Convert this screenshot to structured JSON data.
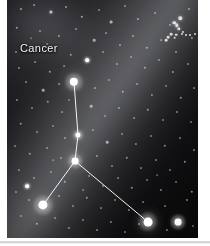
{
  "figure": {
    "kind": "astrophotograph",
    "subject_label": "Cancer",
    "plate": {
      "left": 7,
      "top": 0,
      "width": 191,
      "height": 238,
      "background_color": "#050507",
      "margin_color": "#ffffff"
    },
    "bottom_rule": {
      "color": "#d6d6d6",
      "top": 241,
      "height": 2
    }
  },
  "label": {
    "text": "Cancer",
    "color": "#f2f2f2",
    "x": 13,
    "y": 42
  },
  "glow": {
    "name": "zodiacal-light-band",
    "angle_deg": 34,
    "color": "#eceef5",
    "description": "broad diffuse diagonal glow from upper right to lower left"
  },
  "asterism": {
    "name": "cancer-y-asterism",
    "line_color": "#f5f5f5",
    "line_width": 1,
    "nodes": [
      {
        "id": "n1",
        "name": "iota-cancri",
        "x": 67,
        "y": 82,
        "r": 4.2,
        "brightness": "bright"
      },
      {
        "id": "n2",
        "name": "gamma-cancri",
        "x": 71,
        "y": 135,
        "r": 2.6,
        "brightness": "medium"
      },
      {
        "id": "n3",
        "name": "delta-cancri",
        "x": 68,
        "y": 161,
        "r": 3.4,
        "brightness": "bright"
      },
      {
        "id": "n4",
        "name": "beta-cancri",
        "x": 36,
        "y": 205,
        "r": 4.6,
        "brightness": "bright"
      },
      {
        "id": "n5",
        "name": "alpha-cancri",
        "x": 141,
        "y": 222,
        "r": 4.4,
        "brightness": "bright"
      }
    ],
    "edges": [
      {
        "from": "n1",
        "to": "n2"
      },
      {
        "from": "n2",
        "to": "n3"
      },
      {
        "from": "n3",
        "to": "n4"
      },
      {
        "from": "n3",
        "to": "n5"
      }
    ]
  },
  "cluster": {
    "name": "beehive-cluster",
    "x": 172,
    "y": 32,
    "radius": 16,
    "member_count": 14
  },
  "starfield": {
    "color": "#ffffff",
    "stars": [
      {
        "x": 14,
        "y": 9,
        "r": 1.1,
        "o": 0.55
      },
      {
        "x": 27,
        "y": 5,
        "r": 0.9,
        "o": 0.45
      },
      {
        "x": 44,
        "y": 12,
        "r": 1.6,
        "o": 0.7
      },
      {
        "x": 59,
        "y": 7,
        "r": 1.0,
        "o": 0.5
      },
      {
        "x": 75,
        "y": 17,
        "r": 1.2,
        "o": 0.55
      },
      {
        "x": 92,
        "y": 10,
        "r": 1.0,
        "o": 0.45
      },
      {
        "x": 104,
        "y": 22,
        "r": 1.4,
        "o": 0.6
      },
      {
        "x": 118,
        "y": 6,
        "r": 1.0,
        "o": 0.45
      },
      {
        "x": 131,
        "y": 19,
        "r": 1.1,
        "o": 0.5
      },
      {
        "x": 148,
        "y": 13,
        "r": 0.9,
        "o": 0.4
      },
      {
        "x": 163,
        "y": 25,
        "r": 1.0,
        "o": 0.45
      },
      {
        "x": 182,
        "y": 9,
        "r": 1.1,
        "o": 0.5
      },
      {
        "x": 10,
        "y": 28,
        "r": 1.2,
        "o": 0.5
      },
      {
        "x": 33,
        "y": 31,
        "r": 1.0,
        "o": 0.45
      },
      {
        "x": 52,
        "y": 36,
        "r": 1.1,
        "o": 0.5
      },
      {
        "x": 69,
        "y": 29,
        "r": 0.9,
        "o": 0.4
      },
      {
        "x": 87,
        "y": 40,
        "r": 1.3,
        "o": 0.55
      },
      {
        "x": 99,
        "y": 33,
        "r": 0.9,
        "o": 0.4
      },
      {
        "x": 113,
        "y": 45,
        "r": 1.0,
        "o": 0.45
      },
      {
        "x": 126,
        "y": 36,
        "r": 1.1,
        "o": 0.5
      },
      {
        "x": 140,
        "y": 48,
        "r": 1.2,
        "o": 0.5
      },
      {
        "x": 154,
        "y": 40,
        "r": 0.9,
        "o": 0.4
      },
      {
        "x": 169,
        "y": 52,
        "r": 1.0,
        "o": 0.45
      },
      {
        "x": 185,
        "y": 38,
        "r": 1.1,
        "o": 0.5
      },
      {
        "x": 9,
        "y": 52,
        "r": 1.0,
        "o": 0.42
      },
      {
        "x": 64,
        "y": 55,
        "r": 1.2,
        "o": 0.5
      },
      {
        "x": 80,
        "y": 60,
        "r": 1.5,
        "o": 0.62
      },
      {
        "x": 96,
        "y": 52,
        "r": 1.0,
        "o": 0.45
      },
      {
        "x": 110,
        "y": 64,
        "r": 1.1,
        "o": 0.48
      },
      {
        "x": 124,
        "y": 57,
        "r": 0.9,
        "o": 0.4
      },
      {
        "x": 138,
        "y": 68,
        "r": 1.2,
        "o": 0.5
      },
      {
        "x": 152,
        "y": 60,
        "r": 1.0,
        "o": 0.42
      },
      {
        "x": 166,
        "y": 72,
        "r": 1.1,
        "o": 0.48
      },
      {
        "x": 181,
        "y": 64,
        "r": 1.0,
        "o": 0.45
      },
      {
        "x": 12,
        "y": 68,
        "r": 1.1,
        "o": 0.45
      },
      {
        "x": 28,
        "y": 62,
        "r": 0.9,
        "o": 0.4
      },
      {
        "x": 43,
        "y": 72,
        "r": 1.2,
        "o": 0.5
      },
      {
        "x": 57,
        "y": 66,
        "r": 0.9,
        "o": 0.38
      },
      {
        "x": 19,
        "y": 82,
        "r": 1.0,
        "o": 0.45
      },
      {
        "x": 36,
        "y": 90,
        "r": 1.3,
        "o": 0.55
      },
      {
        "x": 52,
        "y": 84,
        "r": 0.9,
        "o": 0.4
      },
      {
        "x": 88,
        "y": 88,
        "r": 1.1,
        "o": 0.48
      },
      {
        "x": 102,
        "y": 80,
        "r": 1.0,
        "o": 0.42
      },
      {
        "x": 116,
        "y": 92,
        "r": 1.2,
        "o": 0.5
      },
      {
        "x": 130,
        "y": 84,
        "r": 0.9,
        "o": 0.4
      },
      {
        "x": 145,
        "y": 95,
        "r": 1.1,
        "o": 0.46
      },
      {
        "x": 159,
        "y": 86,
        "r": 1.0,
        "o": 0.42
      },
      {
        "x": 174,
        "y": 98,
        "r": 1.2,
        "o": 0.5
      },
      {
        "x": 187,
        "y": 88,
        "r": 0.9,
        "o": 0.4
      },
      {
        "x": 10,
        "y": 100,
        "r": 1.1,
        "o": 0.45
      },
      {
        "x": 25,
        "y": 108,
        "r": 1.0,
        "o": 0.42
      },
      {
        "x": 41,
        "y": 102,
        "r": 1.2,
        "o": 0.5
      },
      {
        "x": 55,
        "y": 112,
        "r": 0.9,
        "o": 0.38
      },
      {
        "x": 84,
        "y": 106,
        "r": 1.3,
        "o": 0.55
      },
      {
        "x": 98,
        "y": 116,
        "r": 1.0,
        "o": 0.42
      },
      {
        "x": 112,
        "y": 108,
        "r": 1.1,
        "o": 0.46
      },
      {
        "x": 127,
        "y": 118,
        "r": 0.9,
        "o": 0.4
      },
      {
        "x": 141,
        "y": 110,
        "r": 1.2,
        "o": 0.5
      },
      {
        "x": 156,
        "y": 120,
        "r": 1.0,
        "o": 0.42
      },
      {
        "x": 170,
        "y": 112,
        "r": 1.1,
        "o": 0.46
      },
      {
        "x": 184,
        "y": 122,
        "r": 1.0,
        "o": 0.42
      },
      {
        "x": 14,
        "y": 124,
        "r": 1.2,
        "o": 0.5
      },
      {
        "x": 30,
        "y": 132,
        "r": 1.0,
        "o": 0.42
      },
      {
        "x": 46,
        "y": 126,
        "r": 0.9,
        "o": 0.38
      },
      {
        "x": 58,
        "y": 138,
        "r": 1.1,
        "o": 0.46
      },
      {
        "x": 86,
        "y": 130,
        "r": 1.0,
        "o": 0.42
      },
      {
        "x": 100,
        "y": 142,
        "r": 1.3,
        "o": 0.55
      },
      {
        "x": 115,
        "y": 134,
        "r": 0.9,
        "o": 0.4
      },
      {
        "x": 129,
        "y": 144,
        "r": 1.1,
        "o": 0.46
      },
      {
        "x": 144,
        "y": 136,
        "r": 1.0,
        "o": 0.42
      },
      {
        "x": 158,
        "y": 146,
        "r": 1.2,
        "o": 0.5
      },
      {
        "x": 173,
        "y": 138,
        "r": 0.9,
        "o": 0.4
      },
      {
        "x": 187,
        "y": 150,
        "r": 1.1,
        "o": 0.46
      },
      {
        "x": 8,
        "y": 146,
        "r": 1.0,
        "o": 0.42
      },
      {
        "x": 23,
        "y": 154,
        "r": 1.2,
        "o": 0.5
      },
      {
        "x": 40,
        "y": 148,
        "r": 0.9,
        "o": 0.38
      },
      {
        "x": 54,
        "y": 158,
        "r": 1.0,
        "o": 0.42
      },
      {
        "x": 90,
        "y": 156,
        "r": 1.1,
        "o": 0.46
      },
      {
        "x": 105,
        "y": 166,
        "r": 1.0,
        "o": 0.42
      },
      {
        "x": 120,
        "y": 158,
        "r": 1.2,
        "o": 0.5
      },
      {
        "x": 134,
        "y": 168,
        "r": 0.9,
        "o": 0.4
      },
      {
        "x": 149,
        "y": 160,
        "r": 1.1,
        "o": 0.46
      },
      {
        "x": 163,
        "y": 170,
        "r": 1.0,
        "o": 0.42
      },
      {
        "x": 178,
        "y": 162,
        "r": 1.2,
        "o": 0.5
      },
      {
        "x": 12,
        "y": 170,
        "r": 1.1,
        "o": 0.46
      },
      {
        "x": 27,
        "y": 178,
        "r": 0.9,
        "o": 0.4
      },
      {
        "x": 44,
        "y": 172,
        "r": 1.0,
        "o": 0.42
      },
      {
        "x": 58,
        "y": 182,
        "r": 1.2,
        "o": 0.5
      },
      {
        "x": 82,
        "y": 176,
        "r": 1.0,
        "o": 0.42
      },
      {
        "x": 96,
        "y": 186,
        "r": 1.1,
        "o": 0.46
      },
      {
        "x": 111,
        "y": 178,
        "r": 0.9,
        "o": 0.4
      },
      {
        "x": 125,
        "y": 188,
        "r": 1.2,
        "o": 0.5
      },
      {
        "x": 140,
        "y": 180,
        "r": 1.0,
        "o": 0.42
      },
      {
        "x": 154,
        "y": 190,
        "r": 1.1,
        "o": 0.46
      },
      {
        "x": 169,
        "y": 182,
        "r": 1.0,
        "o": 0.42
      },
      {
        "x": 185,
        "y": 192,
        "r": 1.2,
        "o": 0.5
      },
      {
        "x": 9,
        "y": 192,
        "r": 1.0,
        "o": 0.42
      },
      {
        "x": 22,
        "y": 200,
        "r": 0.9,
        "o": 0.38
      },
      {
        "x": 52,
        "y": 196,
        "r": 1.1,
        "o": 0.46
      },
      {
        "x": 66,
        "y": 206,
        "r": 1.0,
        "o": 0.42
      },
      {
        "x": 80,
        "y": 198,
        "r": 1.2,
        "o": 0.5
      },
      {
        "x": 94,
        "y": 208,
        "r": 0.9,
        "o": 0.4
      },
      {
        "x": 108,
        "y": 200,
        "r": 1.0,
        "o": 0.42
      },
      {
        "x": 122,
        "y": 210,
        "r": 1.1,
        "o": 0.46
      },
      {
        "x": 136,
        "y": 202,
        "r": 0.9,
        "o": 0.4
      },
      {
        "x": 158,
        "y": 206,
        "r": 1.0,
        "o": 0.42
      },
      {
        "x": 180,
        "y": 200,
        "r": 1.1,
        "o": 0.46
      },
      {
        "x": 14,
        "y": 216,
        "r": 1.0,
        "o": 0.42
      },
      {
        "x": 30,
        "y": 224,
        "r": 1.2,
        "o": 0.5
      },
      {
        "x": 48,
        "y": 218,
        "r": 0.9,
        "o": 0.38
      },
      {
        "x": 62,
        "y": 228,
        "r": 1.1,
        "o": 0.46
      },
      {
        "x": 76,
        "y": 220,
        "r": 1.0,
        "o": 0.42
      },
      {
        "x": 90,
        "y": 230,
        "r": 0.9,
        "o": 0.4
      },
      {
        "x": 104,
        "y": 222,
        "r": 1.1,
        "o": 0.46
      },
      {
        "x": 118,
        "y": 232,
        "r": 1.0,
        "o": 0.42
      },
      {
        "x": 132,
        "y": 224,
        "r": 0.9,
        "o": 0.4
      },
      {
        "x": 160,
        "y": 230,
        "r": 1.1,
        "o": 0.46
      },
      {
        "x": 186,
        "y": 226,
        "r": 1.0,
        "o": 0.42
      },
      {
        "x": 196,
        "y": 212,
        "r": 0.9,
        "o": 0.4
      },
      {
        "x": 40,
        "y": 44,
        "r": 0.9,
        "o": 0.35
      },
      {
        "x": 24,
        "y": 38,
        "r": 0.8,
        "o": 0.3
      },
      {
        "x": 62,
        "y": 100,
        "r": 0.9,
        "o": 0.35
      },
      {
        "x": 46,
        "y": 160,
        "r": 0.8,
        "o": 0.32
      },
      {
        "x": 76,
        "y": 190,
        "r": 0.9,
        "o": 0.35
      },
      {
        "x": 150,
        "y": 175,
        "r": 0.8,
        "o": 0.32
      }
    ],
    "bright_extras": [
      {
        "name": "field-star-right",
        "x": 171,
        "y": 222,
        "r": 3.4
      },
      {
        "name": "field-star-lower-left",
        "x": 20,
        "y": 186,
        "r": 1.8
      },
      {
        "name": "field-star-upper-mid",
        "x": 80,
        "y": 60,
        "r": 1.8
      }
    ]
  }
}
